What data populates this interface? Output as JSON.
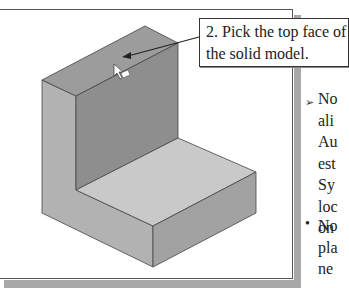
{
  "callout": {
    "line1": "2. Pick the top face of",
    "line2": "the solid model."
  },
  "side_text": {
    "bullet1_icon": "arrow-bullet",
    "bullet1_symbol": "➢",
    "bullet1_lines": [
      "No",
      "ali",
      "Au",
      "est",
      "Sy",
      "loc",
      "on"
    ],
    "bullet2_icon": "dot-bullet",
    "bullet2_symbol": "•",
    "bullet2_lines": [
      "No",
      "pla",
      "ne"
    ]
  },
  "colors": {
    "top_face": "#9a9a9a",
    "back_wall": "#8c8c8c",
    "left_face": "#b4b4b4",
    "floor_top": "#c8c8c8",
    "front_right": "#a0a0a0",
    "edge": "#444444",
    "frame_shadow": "#a8a8a8"
  }
}
